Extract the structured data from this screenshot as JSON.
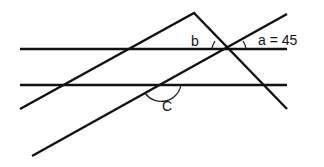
{
  "diagram": {
    "type": "geometry-angles",
    "labels": {
      "a": "a = 45",
      "b": "b",
      "c": "C"
    },
    "line_color": "#111111",
    "background": "#ffffff"
  }
}
